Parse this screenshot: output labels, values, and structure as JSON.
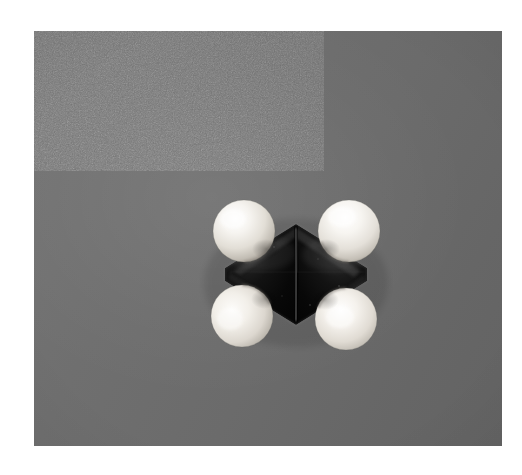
{
  "image": {
    "kind": "photograph",
    "subject_name": "space-filling-molecular-model",
    "caption": "",
    "width": 522,
    "height": 475
  },
  "matte": {
    "color": "#ffffff"
  },
  "photo": {
    "x": 34,
    "y": 31,
    "width": 468,
    "height": 415,
    "background_color": "#6e6e6e",
    "background_highlight_color": "#787878",
    "background_shadow_color": "#626262",
    "grain": "film-grain"
  },
  "molecule": {
    "name": "ethylene-space-filling-model",
    "formula": "C2H4",
    "center": {
      "x": 262,
      "y": 243
    },
    "seam": {
      "x": 262,
      "y_top": 198,
      "y_bottom": 289
    },
    "dark_atoms": {
      "element_label": "C",
      "color": "#0b0b0b",
      "highlight_color": "#4a4a4a",
      "left": {
        "cx": 232,
        "cy": 243,
        "r": 46
      },
      "right": {
        "cx": 292,
        "cy": 243,
        "r": 46
      },
      "rhombus": {
        "left_x": 198,
        "right_x": 330,
        "top_y": 196,
        "bottom_y": 290
      }
    },
    "light_atoms": {
      "element_label": "H",
      "color": "#f2f0ec",
      "shadow_color": "#8e8b86",
      "highlight_color": "#ffffff",
      "spheres": [
        {
          "name": "hydrogen-upper-left",
          "cx": 210,
          "cy": 200,
          "r": 31
        },
        {
          "name": "hydrogen-upper-right",
          "cx": 315,
          "cy": 200,
          "r": 31
        },
        {
          "name": "hydrogen-lower-left",
          "cx": 208,
          "cy": 285,
          "r": 31
        },
        {
          "name": "hydrogen-lower-right",
          "cx": 312,
          "cy": 288,
          "r": 31
        }
      ]
    }
  }
}
